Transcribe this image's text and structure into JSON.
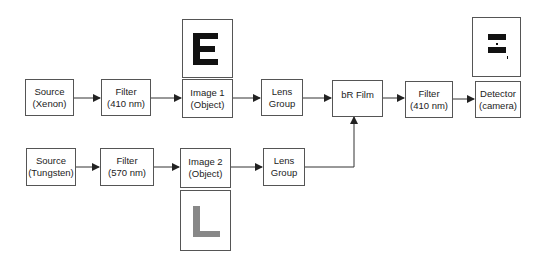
{
  "diagram": {
    "type": "optical setup block diagram",
    "top_row": [
      {
        "id": "source_xenon",
        "line1": "Source",
        "line2": "(Xenon)"
      },
      {
        "id": "filter_410_a",
        "line1": "Filter",
        "line2": "(410 nm)"
      },
      {
        "id": "image1",
        "line1": "Image 1",
        "line2": "(Object)"
      },
      {
        "id": "lens_group_top",
        "line1": "Lens",
        "line2": "Group"
      },
      {
        "id": "br_film",
        "line1": "bR Film",
        "line2": ""
      },
      {
        "id": "filter_410_b",
        "line1": "Filter",
        "line2": "(410 nm)"
      },
      {
        "id": "detector",
        "line1": "Detector",
        "line2": "(camera)"
      }
    ],
    "bottom_row": [
      {
        "id": "source_tungsten",
        "line1": "Source",
        "line2": "(Tungsten)"
      },
      {
        "id": "filter_570",
        "line1": "Filter",
        "line2": "(570 nm)"
      },
      {
        "id": "image2",
        "line1": "Image 2",
        "line2": "(Object)"
      },
      {
        "id": "lens_group_bottom",
        "line1": "Lens",
        "line2": "Group"
      }
    ],
    "object_images": {
      "image1_glyph": "E",
      "image1_color": "#111111",
      "image2_glyph": "L",
      "image2_color": "#888888",
      "detector_output": "partial E (dashes)"
    },
    "colors": {
      "border": "#555555",
      "arrow": "#222222",
      "text": "#222222"
    }
  }
}
